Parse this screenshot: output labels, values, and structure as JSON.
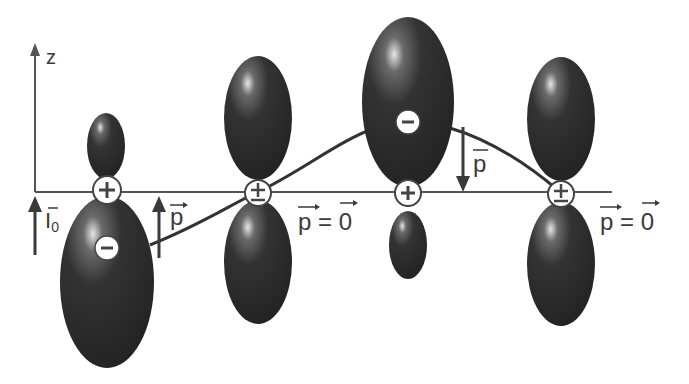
{
  "diagram": {
    "type": "p-orbital wave / momentum illustration",
    "axis": {
      "label": "z"
    },
    "initial_label": {
      "base": "I",
      "subscript": "0"
    },
    "momentum_labels": {
      "up_arrow_1": "p",
      "zero_1": {
        "left": "p",
        "eq": "=",
        "right": "0"
      },
      "down_arrow": "p",
      "zero_2": {
        "left": "p",
        "eq": "=",
        "right": "0"
      }
    },
    "orbitals": [
      {
        "id": "orbital-1",
        "nucleus_sign": "+",
        "upper_lobe": "small",
        "lower_lobe": "large",
        "lobe_sign": "-",
        "lobe_sign_position": "lower"
      },
      {
        "id": "orbital-2",
        "nucleus_sign": "±",
        "upper_lobe": "medium",
        "lower_lobe": "medium"
      },
      {
        "id": "orbital-3",
        "nucleus_sign": "+",
        "upper_lobe": "large",
        "lower_lobe": "small",
        "lobe_sign": "-",
        "lobe_sign_position": "upper"
      },
      {
        "id": "orbital-4",
        "nucleus_sign": "±",
        "upper_lobe": "medium",
        "lower_lobe": "medium"
      }
    ],
    "colors": {
      "lobe": "#2b2b2b",
      "lobe_highlight": "#cfcfcf",
      "line": "#3a3a3a",
      "background": "#ffffff"
    }
  }
}
